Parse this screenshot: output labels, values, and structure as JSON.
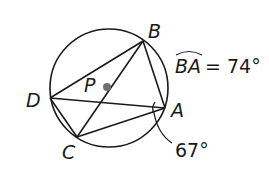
{
  "diagram": {
    "type": "inscribed-quadrilateral-circle",
    "circle": {
      "cx": 109,
      "cy": 88,
      "r": 59
    },
    "points": {
      "B": {
        "label": "B",
        "x": 143,
        "y": 41
      },
      "A": {
        "label": "A",
        "x": 165,
        "y": 108
      },
      "C": {
        "label": "C",
        "x": 77,
        "y": 137
      },
      "D": {
        "label": "D",
        "x": 50,
        "y": 98
      },
      "P": {
        "label": "P",
        "x": 107,
        "y": 87
      }
    },
    "segments": [
      "DB",
      "BA",
      "AC",
      "CD",
      "DA",
      "CB"
    ],
    "annotations": {
      "arc_name": "BA",
      "arc_equals": "= 74°",
      "angle_value": "67°"
    },
    "colors": {
      "stroke": "#1a1a1a",
      "center_dot": "#707070",
      "background": "#ffffff"
    }
  }
}
